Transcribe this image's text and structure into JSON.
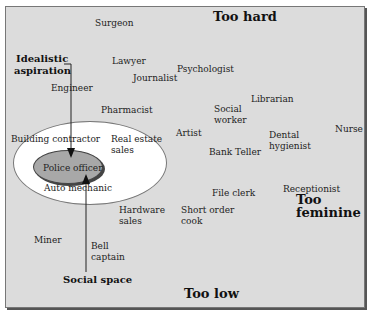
{
  "labels": {
    "too_hard": "Too hard",
    "too_low": "Too low",
    "too_feminine_1": "Too",
    "too_feminine_2": "feminine",
    "idealistic_1": "Idealistic",
    "idealistic_2": "aspiration",
    "social_space": "Social space"
  },
  "occupations": {
    "surgeon": "Surgeon",
    "lawyer": "Lawyer",
    "journalist": "Journalist",
    "psychologist": "Psychologist",
    "engineer": "Engineer",
    "pharmacist": "Pharmacist",
    "librarian": "Librarian",
    "social_worker_1": "Social",
    "social_worker_2": "worker",
    "building_contractor": "Building contractor",
    "real_estate_1": "Real estate",
    "real_estate_2": "sales",
    "artist": "Artist",
    "dental_1": "Dental",
    "dental_2": "hygienist",
    "nurse": "Nurse",
    "bank_teller": "Bank Teller",
    "police_officer": "Police officer",
    "auto_mechanic": "Auto mechanic",
    "file_clerk": "File clerk",
    "receptionist": "Receptionist",
    "hardware_1": "Hardware",
    "hardware_2": "sales",
    "short_order_1": "Short order",
    "short_order_2": "cook",
    "miner": "Miner",
    "bell_1": "Bell",
    "bell_2": "captain"
  }
}
